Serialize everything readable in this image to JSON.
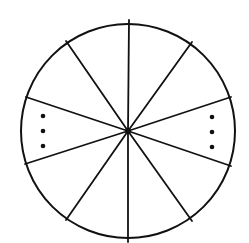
{
  "diagram": {
    "type": "divided-circle",
    "colors": {
      "stroke": "#111111",
      "fill": "#ffffff",
      "dot": "#111111"
    },
    "circle": {
      "cx": 128,
      "cy": 131,
      "r": 107,
      "stroke_width": 2
    },
    "center_dot": {
      "cx": 128,
      "cy": 131,
      "r": 3
    },
    "spokes": [
      {
        "x": 129,
        "y": 20
      },
      {
        "x": 192,
        "y": 42
      },
      {
        "x": 231,
        "y": 97
      },
      {
        "x": 231,
        "y": 166
      },
      {
        "x": 192,
        "y": 221
      },
      {
        "x": 128,
        "y": 242
      },
      {
        "x": 66,
        "y": 220
      },
      {
        "x": 25,
        "y": 164
      },
      {
        "x": 26,
        "y": 97
      },
      {
        "x": 66,
        "y": 41
      }
    ],
    "ellipsis_groups": [
      {
        "name": "left-sector-ellipsis",
        "dots": [
          {
            "cx": 43,
            "cy": 116
          },
          {
            "cx": 43,
            "cy": 131
          },
          {
            "cx": 43,
            "cy": 146
          }
        ],
        "r": 2.3
      },
      {
        "name": "right-sector-ellipsis",
        "dots": [
          {
            "cx": 212,
            "cy": 117
          },
          {
            "cx": 212,
            "cy": 132
          },
          {
            "cx": 212,
            "cy": 147
          }
        ],
        "r": 2.3
      }
    ]
  }
}
